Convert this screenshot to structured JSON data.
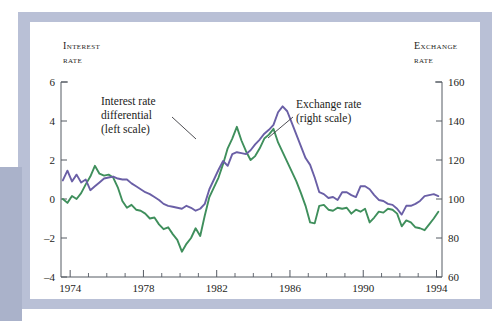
{
  "figure": {
    "background": "#ffffff",
    "frame_color": "#b9c0d6",
    "tab_color": "#aab2ca"
  },
  "axes": {
    "left_title_line1": "Interest",
    "left_title_line2": "rate",
    "right_title_line1": "Exchange",
    "right_title_line2": "rate",
    "left_ticks": [
      "6",
      "4",
      "2",
      "0",
      "–2",
      "–4"
    ],
    "right_ticks": [
      "160",
      "140",
      "120",
      "100",
      "80",
      "60"
    ],
    "x_ticks": [
      "1974",
      "1978",
      "1982",
      "1986",
      "1990",
      "1994"
    ]
  },
  "annotations": [
    {
      "name": "interest-rate-annotation",
      "line1": "Interest rate",
      "line2": "differential",
      "line3": "(left scale)"
    },
    {
      "name": "exchange-rate-annotation",
      "line1": "Exchange rate",
      "line2": "(right scale)"
    }
  ],
  "chart_data": {
    "type": "line",
    "title": "",
    "xlabel": "",
    "ylabel": "Interest rate",
    "y2label": "Exchange rate",
    "xlim": [
      1973.5,
      1994.3
    ],
    "ylim": [
      -4,
      6
    ],
    "y2lim": [
      60,
      160
    ],
    "grid": false,
    "legend": "annotations",
    "x_tick_values": [
      1974,
      1978,
      1982,
      1986,
      1990,
      1994
    ],
    "x_minor_tick_step": 1,
    "left_tick_values": [
      6,
      4,
      2,
      0,
      -2,
      -4
    ],
    "right_tick_values": [
      160,
      140,
      120,
      100,
      80,
      60
    ],
    "series": [
      {
        "name": "Interest rate differential (left scale)",
        "axis": "left",
        "color": "#3f8f5c",
        "x": [
          1973.6,
          1973.85,
          1974.1,
          1974.35,
          1974.6,
          1974.85,
          1975.1,
          1975.35,
          1975.6,
          1975.85,
          1976.1,
          1976.35,
          1976.6,
          1976.85,
          1977.1,
          1977.35,
          1977.6,
          1977.85,
          1978.1,
          1978.35,
          1978.6,
          1978.85,
          1979.1,
          1979.35,
          1979.6,
          1979.85,
          1980.1,
          1980.35,
          1980.6,
          1980.85,
          1981.1,
          1981.35,
          1981.6,
          1981.85,
          1982.1,
          1982.35,
          1982.6,
          1982.85,
          1983.1,
          1983.35,
          1983.6,
          1983.85,
          1984.1,
          1984.35,
          1984.6,
          1984.85,
          1985.1,
          1985.35,
          1985.6,
          1985.85,
          1986.1,
          1986.35,
          1986.6,
          1986.85,
          1987.1,
          1987.35,
          1987.6,
          1987.85,
          1988.1,
          1988.35,
          1988.6,
          1988.85,
          1989.1,
          1989.35,
          1989.6,
          1989.85,
          1990.1,
          1990.35,
          1990.6,
          1990.85,
          1991.1,
          1991.35,
          1991.6,
          1991.85,
          1992.1,
          1992.35,
          1992.6,
          1992.85,
          1993.1,
          1993.35,
          1993.6,
          1993.85,
          1994.1
        ],
        "y": [
          0.0,
          -0.2,
          0.15,
          0.0,
          0.3,
          0.75,
          1.15,
          1.7,
          1.3,
          1.2,
          1.25,
          1.1,
          0.6,
          -0.1,
          -0.45,
          -0.3,
          -0.55,
          -0.6,
          -0.75,
          -1.0,
          -0.95,
          -1.3,
          -1.55,
          -1.45,
          -1.8,
          -2.1,
          -2.7,
          -2.3,
          -2.0,
          -1.5,
          -1.9,
          -0.85,
          0.1,
          0.6,
          1.1,
          1.8,
          2.6,
          3.1,
          3.7,
          3.0,
          2.45,
          2.0,
          2.2,
          2.6,
          3.1,
          3.3,
          3.6,
          2.9,
          2.4,
          1.9,
          1.4,
          0.9,
          0.3,
          -0.35,
          -1.2,
          -1.25,
          -0.35,
          -0.3,
          -0.55,
          -0.6,
          -0.45,
          -0.5,
          -0.45,
          -0.75,
          -0.55,
          -0.65,
          -0.5,
          -1.2,
          -0.95,
          -0.65,
          -0.7,
          -0.5,
          -0.55,
          -0.75,
          -1.4,
          -1.1,
          -1.2,
          -1.45,
          -1.5,
          -1.6,
          -1.3,
          -1.0,
          -0.65
        ]
      },
      {
        "name": "Exchange rate (right scale)",
        "axis": "right",
        "color": "#6a5fa6",
        "x": [
          1973.6,
          1973.85,
          1974.1,
          1974.35,
          1974.6,
          1974.85,
          1975.1,
          1975.35,
          1975.6,
          1975.85,
          1976.1,
          1976.35,
          1976.6,
          1976.85,
          1977.1,
          1977.35,
          1977.6,
          1977.85,
          1978.1,
          1978.35,
          1978.6,
          1978.85,
          1979.1,
          1979.35,
          1979.6,
          1979.85,
          1980.1,
          1980.35,
          1980.6,
          1980.85,
          1981.1,
          1981.35,
          1981.6,
          1981.85,
          1982.1,
          1982.35,
          1982.6,
          1982.85,
          1983.1,
          1983.35,
          1983.6,
          1983.85,
          1984.1,
          1984.35,
          1984.6,
          1984.85,
          1985.1,
          1985.35,
          1985.6,
          1985.85,
          1986.1,
          1986.35,
          1986.6,
          1986.85,
          1987.1,
          1987.35,
          1987.6,
          1987.85,
          1988.1,
          1988.35,
          1988.6,
          1988.85,
          1989.1,
          1989.35,
          1989.6,
          1989.85,
          1990.1,
          1990.35,
          1990.6,
          1990.85,
          1991.1,
          1991.35,
          1991.6,
          1991.85,
          1992.1,
          1992.35,
          1992.6,
          1992.85,
          1993.1,
          1993.35,
          1993.6,
          1993.85,
          1994.1
        ],
        "y": [
          109.5,
          114.5,
          109.0,
          112.5,
          108.5,
          110.0,
          104.5,
          106.5,
          108.5,
          110.5,
          111.0,
          111.5,
          110.5,
          110.0,
          110.0,
          108.0,
          106.5,
          105.0,
          103.5,
          102.5,
          101.0,
          99.5,
          97.5,
          96.5,
          96.0,
          95.5,
          95.0,
          96.5,
          95.5,
          94.0,
          95.0,
          97.5,
          105.0,
          110.0,
          115.0,
          119.5,
          117.0,
          123.0,
          124.0,
          123.5,
          123.0,
          125.0,
          128.0,
          130.5,
          133.5,
          135.5,
          138.0,
          144.5,
          147.5,
          145.0,
          139.0,
          133.0,
          127.0,
          121.0,
          117.5,
          111.0,
          103.5,
          102.5,
          100.5,
          101.0,
          99.5,
          103.5,
          103.5,
          102.0,
          101.0,
          106.5,
          106.5,
          105.0,
          102.0,
          99.5,
          99.0,
          97.5,
          97.0,
          95.0,
          92.0,
          96.5,
          96.5,
          97.5,
          99.0,
          101.5,
          102.0,
          102.5,
          101.5
        ]
      }
    ]
  }
}
